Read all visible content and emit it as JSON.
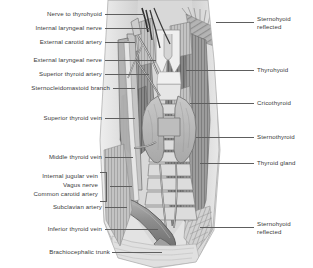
{
  "figure": {
    "type": "anatomical-illustration",
    "style": "grayscale pen-and-ink medical illustration",
    "background_color": "#ffffff",
    "label_color": "#3a3a3a",
    "leader_color": "#5e5e5e"
  },
  "labels_left": [
    {
      "id": "nerve-to-thyrohyoid",
      "text": "Nerve to thyrohyoid"
    },
    {
      "id": "internal-laryngeal-nerve",
      "text": "Internal laryngeal nerve"
    },
    {
      "id": "external-carotid-artery",
      "text": "External carotid artery"
    },
    {
      "id": "external-laryngeal-nerve",
      "text": "External laryngeal nerve"
    },
    {
      "id": "superior-thyroid-artery",
      "text": "Superior thyroid artery"
    },
    {
      "id": "sternocleidomastoid-branch",
      "text": "Sternocleidomastoid branch"
    },
    {
      "id": "superior-thyroid-vein",
      "text": "Superior thyroid vein"
    },
    {
      "id": "middle-thyroid-vein",
      "text": "Middle thyroid vein"
    },
    {
      "id": "internal-jugular-vein",
      "text": "Internal jugular vein"
    },
    {
      "id": "vagus-nerve",
      "text": "Vagus nerve"
    },
    {
      "id": "common-carotid-artery",
      "text": "Common carotid artery"
    },
    {
      "id": "subclavian-artery",
      "text": "Subclavian artery"
    },
    {
      "id": "inferior-thyroid-vein",
      "text": "Inferior thyroid vein"
    },
    {
      "id": "brachiocephalic-trunk",
      "text": "Brachiocephalic trunk"
    }
  ],
  "labels_right": [
    {
      "id": "sternohyoid-reflected-top",
      "line1": "Sternohyoid",
      "line2": "reflected"
    },
    {
      "id": "thyrohyoid",
      "line1": "Thyrohyoid",
      "line2": ""
    },
    {
      "id": "cricothyroid",
      "line1": "Cricothyroid",
      "line2": ""
    },
    {
      "id": "sternothyroid",
      "line1": "Sternothyroid",
      "line2": ""
    },
    {
      "id": "thyroid-gland",
      "line1": "Thyroid gland",
      "line2": ""
    },
    {
      "id": "sternohyoid-reflected-bottom",
      "line1": "Sternohyoid",
      "line2": "reflected"
    }
  ]
}
